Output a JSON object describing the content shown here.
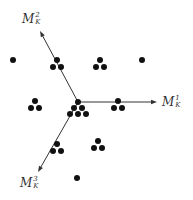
{
  "diagram": {
    "origin": [
      78,
      102
    ],
    "axes": [
      {
        "id": "m1",
        "base": "M",
        "superscript": "1",
        "subscript": "K",
        "from": [
          78,
          102
        ],
        "to": [
          157,
          102
        ],
        "label_pos": [
          162,
          95
        ]
      },
      {
        "id": "m2",
        "base": "M",
        "superscript": "2",
        "subscript": "K",
        "from": [
          78,
          102
        ],
        "to": [
          40,
          31
        ],
        "label_pos": [
          22,
          12
        ]
      },
      {
        "id": "m3",
        "base": "M",
        "superscript": "3",
        "subscript": "K",
        "from": [
          78,
          102
        ],
        "to": [
          38,
          172
        ],
        "label_pos": [
          20,
          176
        ]
      }
    ],
    "single_dots": [
      [
        13,
        60
      ],
      [
        142,
        60
      ],
      [
        77,
        178
      ]
    ],
    "triangle_clusters": [
      [
        [
          57,
          60
        ],
        [
          53,
          67
        ],
        [
          61,
          67
        ]
      ],
      [
        [
          100,
          60
        ],
        [
          96,
          67
        ],
        [
          104,
          67
        ]
      ],
      [
        [
          35,
          101
        ],
        [
          31,
          108
        ],
        [
          39,
          108
        ]
      ],
      [
        [
          118,
          101
        ],
        [
          114,
          108
        ],
        [
          122,
          108
        ]
      ],
      [
        [
          57,
          144
        ],
        [
          53,
          151
        ],
        [
          61,
          151
        ]
      ],
      [
        [
          98,
          141
        ],
        [
          94,
          148
        ],
        [
          102,
          148
        ]
      ]
    ],
    "center_cluster": [
      [
        78,
        102
      ],
      [
        74,
        108
      ],
      [
        82,
        108
      ],
      [
        70,
        114
      ],
      [
        78,
        114
      ],
      [
        86,
        114
      ]
    ],
    "dot_radius": 3,
    "colors": {
      "axis": "#333333",
      "dot": "#111111",
      "background": "#ffffff"
    }
  }
}
